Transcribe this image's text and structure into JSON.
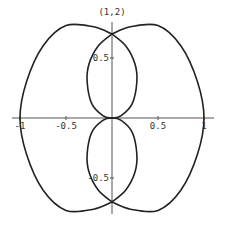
{
  "chart_data": {
    "type": "line",
    "title": "(1,2)",
    "xlabel": "",
    "ylabel": "",
    "xlim": [
      -1.05,
      1.05
    ],
    "ylim": [
      -0.85,
      0.85
    ],
    "grid": false,
    "x_ticks": [
      {
        "value": -1,
        "label": "-1"
      },
      {
        "value": -0.5,
        "label": "-0.5"
      },
      {
        "value": 0.5,
        "label": "0.5"
      },
      {
        "value": 1,
        "label": "1"
      }
    ],
    "y_ticks": [
      {
        "value": 0.5,
        "label": "0.5"
      },
      {
        "value": -0.5,
        "label": "-0.5"
      }
    ],
    "series": [
      {
        "name": "curve",
        "description": "closed parametric curve: two outer lobes and two inner loops",
        "segments": [
          {
            "name": "outer-right-lobe",
            "points": [
              [
                0,
                0.7
              ],
              [
                0.2,
                0.76
              ],
              [
                0.5,
                0.77
              ],
              [
                0.75,
                0.6
              ],
              [
                0.93,
                0.3
              ],
              [
                1,
                0
              ],
              [
                0.93,
                -0.3
              ],
              [
                0.75,
                -0.6
              ],
              [
                0.5,
                -0.77
              ],
              [
                0.2,
                -0.76
              ],
              [
                0,
                -0.7
              ]
            ]
          },
          {
            "name": "outer-left-lobe",
            "points": [
              [
                0,
                0.7
              ],
              [
                -0.2,
                0.76
              ],
              [
                -0.5,
                0.77
              ],
              [
                -0.75,
                0.6
              ],
              [
                -0.93,
                0.3
              ],
              [
                -1,
                0
              ],
              [
                -0.93,
                -0.3
              ],
              [
                -0.75,
                -0.6
              ],
              [
                -0.5,
                -0.77
              ],
              [
                -0.2,
                -0.76
              ],
              [
                0,
                -0.7
              ]
            ]
          },
          {
            "name": "inner-upper-loop",
            "points": [
              [
                0,
                0.7
              ],
              [
                0.15,
                0.6
              ],
              [
                0.25,
                0.45
              ],
              [
                0.27,
                0.3
              ],
              [
                0.22,
                0.12
              ],
              [
                0.1,
                0.02
              ],
              [
                0,
                0
              ],
              [
                -0.1,
                0.02
              ],
              [
                -0.22,
                0.12
              ],
              [
                -0.27,
                0.3
              ],
              [
                -0.25,
                0.45
              ],
              [
                -0.15,
                0.6
              ],
              [
                0,
                0.7
              ]
            ]
          },
          {
            "name": "inner-lower-loop",
            "points": [
              [
                0,
                -0.7
              ],
              [
                0.15,
                -0.6
              ],
              [
                0.25,
                -0.45
              ],
              [
                0.27,
                -0.3
              ],
              [
                0.22,
                -0.12
              ],
              [
                0.1,
                -0.02
              ],
              [
                0,
                0
              ],
              [
                -0.1,
                -0.02
              ],
              [
                -0.22,
                -0.12
              ],
              [
                -0.27,
                -0.3
              ],
              [
                -0.25,
                -0.45
              ],
              [
                -0.15,
                -0.6
              ],
              [
                0,
                -0.7
              ]
            ]
          }
        ]
      }
    ]
  }
}
